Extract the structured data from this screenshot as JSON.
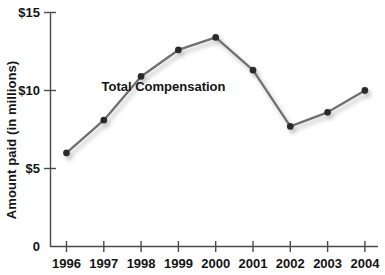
{
  "chart_data": {
    "type": "line",
    "title": "",
    "subtitle": "",
    "xlabel": "",
    "ylabel": "Amount paid (in millions)",
    "categories": [
      "1996",
      "1997",
      "1998",
      "1999",
      "2000",
      "2001",
      "2002",
      "2003",
      "2004"
    ],
    "x": [
      1996,
      1997,
      1998,
      1999,
      2000,
      2001,
      2002,
      2003,
      2004
    ],
    "series": [
      {
        "name": "Total Compensation",
        "values": [
          6.0,
          8.1,
          10.9,
          12.6,
          13.4,
          11.3,
          7.7,
          8.6,
          10.0
        ]
      }
    ],
    "ylim": [
      0,
      15
    ],
    "ytick_values": [
      0,
      5,
      10,
      15
    ],
    "ytick_labels": [
      "0",
      "$5",
      "$10",
      "$15"
    ],
    "xtick_labels": [
      "1996",
      "1997",
      "1998",
      "1999",
      "2000",
      "2001",
      "2002",
      "2003",
      "2004"
    ],
    "grid": false,
    "legend": "none",
    "annotations": [
      {
        "text": "Total Compensation",
        "x": 1998.6,
        "y": 10.2
      }
    ],
    "colors": {
      "line": "#6f6f6f",
      "marker": "#2b2b2b",
      "shadow": "#cfcfcf",
      "axis": "#4a4a4a",
      "text": "#141414",
      "background": "#ffffff"
    }
  },
  "axis": {
    "y_title": "Amount paid (in millions)",
    "y_labels": {
      "t15": "$15",
      "t10": "$10",
      "t5": "$5",
      "t0": "0"
    },
    "x_labels": {
      "y1996": "1996",
      "y1997": "1997",
      "y1998": "1998",
      "y1999": "1999",
      "y2000": "2000",
      "y2001": "2001",
      "y2002": "2002",
      "y2003": "2003",
      "y2004": "2004"
    }
  },
  "series_label": {
    "total_compensation": "Total Compensation"
  }
}
